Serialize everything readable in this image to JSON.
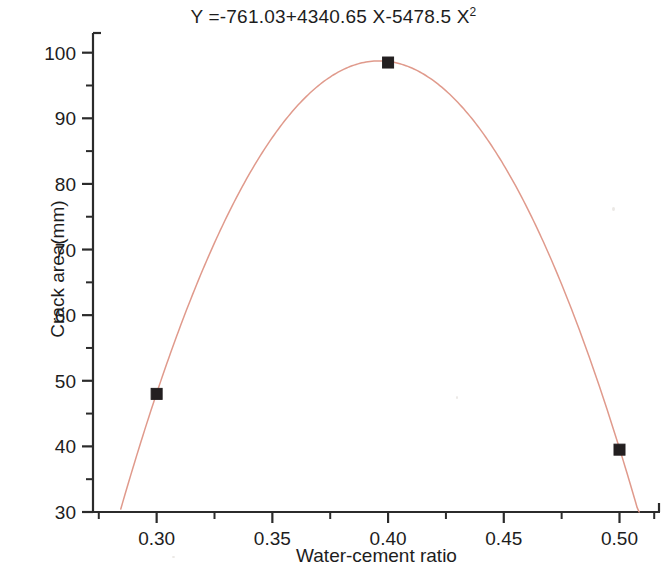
{
  "figure": {
    "equation_prefix": "Y =-761.03+4340.65 X-5478.5 X",
    "equation_exponent": "2",
    "equation_full": "Y =-761.03+4340.65 X-5478.5 X²",
    "curve_color": "#e09a8c",
    "marker_color": "#231f20",
    "axis_color": "#2b2b2b",
    "background_color": "#ffffff"
  },
  "chart_data": {
    "type": "scatter",
    "xlabel": "Water-cement ratio",
    "ylabel": "Crack area(mm)",
    "xlim": [
      0.2725,
      0.5175
    ],
    "ylim": [
      30,
      103
    ],
    "grid": false,
    "legend": null,
    "x_ticks": [
      0.3,
      0.35,
      0.4,
      0.45,
      0.5
    ],
    "x_tick_labels": [
      "0.30",
      "0.35",
      "0.40",
      "0.45",
      "0.50"
    ],
    "x_minor_ticks": [
      0.275,
      0.325,
      0.375,
      0.425,
      0.475,
      0.515
    ],
    "y_ticks": [
      30,
      40,
      50,
      60,
      70,
      80,
      90,
      100
    ],
    "y_tick_labels": [
      "30",
      "40",
      "50",
      "60",
      "70",
      "80",
      "90",
      "100"
    ],
    "y_minor_ticks": [
      35,
      45,
      55,
      65,
      75,
      85,
      95
    ],
    "series": [
      {
        "name": "Measured crack area",
        "type": "scatter",
        "marker": "square",
        "color": "#231f20",
        "x": [
          0.3,
          0.4,
          0.5
        ],
        "y": [
          48.0,
          98.5,
          39.5
        ]
      },
      {
        "name": "Quadratic fit",
        "type": "line",
        "color": "#e09a8c",
        "equation": "Y = -761.03 + 4340.65*X - 5478.5*X^2",
        "coefficients": {
          "a": -5478.5,
          "b": 4340.65,
          "c": -761.03
        },
        "vertex": {
          "x": 0.3962,
          "y": 98.7
        },
        "x_range": [
          0.2845,
          0.5085
        ]
      }
    ]
  }
}
